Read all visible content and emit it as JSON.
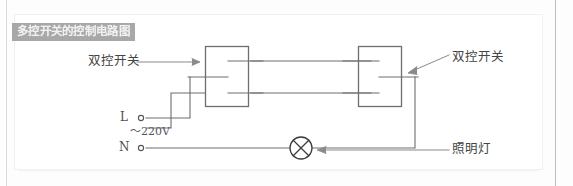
{
  "diagram": {
    "title": "多控开关的控制电路图",
    "title_bg": "#a8a8a8",
    "title_fg": "#f0f0f0",
    "wire_color": "#6e6e6e",
    "background": "#ffffff",
    "labels": {
      "switch_left": "双控开关",
      "switch_right": "双控开关",
      "lamp": "照明灯",
      "terminal_live": "L",
      "terminal_neutral": "N",
      "voltage": "～220V"
    },
    "components": [
      {
        "name": "switch-left",
        "type": "two-way-switch",
        "label": "双控开关"
      },
      {
        "name": "switch-right",
        "type": "two-way-switch",
        "label": "双控开关"
      },
      {
        "name": "lamp",
        "type": "lamp",
        "label": "照明灯"
      },
      {
        "name": "terminal-live",
        "type": "terminal",
        "label": "L"
      },
      {
        "name": "terminal-neutral",
        "type": "terminal",
        "label": "N"
      }
    ]
  }
}
